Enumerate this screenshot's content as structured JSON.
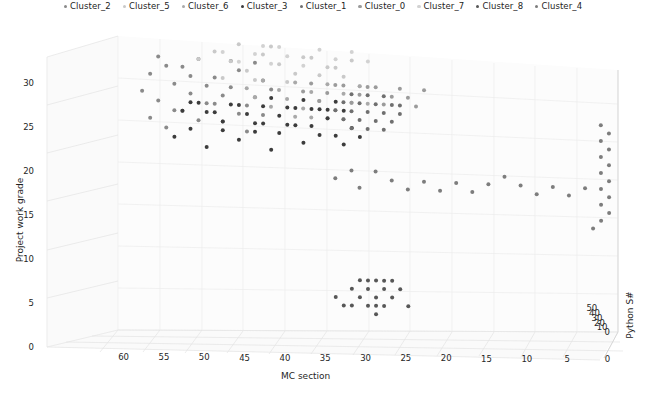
{
  "figure": {
    "background": "#ffffff",
    "projection": "3d",
    "width": 646,
    "height": 394
  },
  "legend": {
    "position": "top-center",
    "marker": "circle",
    "entries": [
      {
        "label": "Cluster_2",
        "color": "#8a8a8a"
      },
      {
        "label": "Cluster_5",
        "color": "#c9c9c9"
      },
      {
        "label": "Cluster_6",
        "color": "#a9a9a9"
      },
      {
        "label": "Cluster_3",
        "color": "#3c3c3c"
      },
      {
        "label": "Cluster_1",
        "color": "#6f6f6f"
      },
      {
        "label": "Cluster_0",
        "color": "#9b9b9b"
      },
      {
        "label": "Cluster_7",
        "color": "#d2d2d2"
      },
      {
        "label": "Cluster_8",
        "color": "#575757"
      },
      {
        "label": "Cluster_4",
        "color": "#7d7d7d"
      }
    ]
  },
  "chart_data": {
    "type": "scatter",
    "title": "",
    "xlabel": "MC section",
    "ylabel": "Project work grade",
    "zlabel": "Python S#",
    "xticks": [
      60,
      55,
      50,
      45,
      40,
      35,
      30,
      25,
      20,
      15,
      10,
      5,
      0
    ],
    "yticks": [
      0,
      5,
      10,
      15,
      20,
      25,
      30
    ],
    "zticks": [
      0,
      10,
      20,
      30,
      40,
      50
    ],
    "xlim": [
      62,
      0
    ],
    "ylim": [
      0,
      33
    ],
    "zlim": [
      0,
      55
    ],
    "grid": true,
    "legend_position": "upper center",
    "series": [
      {
        "name": "Cluster_2",
        "color": "#8a8a8a",
        "points": [
          [
            59,
            27,
            4
          ],
          [
            58,
            29,
            5
          ],
          [
            57,
            26,
            3
          ],
          [
            56,
            30,
            6
          ],
          [
            55,
            28,
            4
          ],
          [
            54,
            25,
            5
          ],
          [
            53,
            27,
            3
          ],
          [
            52,
            31,
            7
          ],
          [
            51,
            26,
            4
          ],
          [
            50,
            29,
            5
          ],
          [
            49,
            24,
            3
          ],
          [
            48,
            28,
            6
          ],
          [
            47,
            30,
            4
          ],
          [
            46,
            26,
            5
          ],
          [
            45,
            27,
            3
          ],
          [
            44,
            29,
            6
          ],
          [
            58,
            24,
            4
          ],
          [
            56,
            23,
            5
          ],
          [
            54,
            30,
            3
          ],
          [
            52,
            24,
            6
          ],
          [
            50,
            26,
            4
          ],
          [
            48,
            31,
            5
          ],
          [
            46,
            23,
            3
          ],
          [
            44,
            25,
            7
          ],
          [
            57,
            31,
            5
          ],
          [
            55,
            25,
            4
          ],
          [
            53,
            29,
            6
          ],
          [
            51,
            28,
            3
          ],
          [
            49,
            27,
            5
          ],
          [
            47,
            25,
            4
          ],
          [
            45,
            31,
            6
          ],
          [
            43,
            28,
            3
          ]
        ]
      },
      {
        "name": "Cluster_5",
        "color": "#c9c9c9",
        "points": [
          [
            50,
            32,
            8
          ],
          [
            48,
            31,
            9
          ],
          [
            46,
            30,
            7
          ],
          [
            44,
            32,
            10
          ],
          [
            42,
            31,
            8
          ],
          [
            40,
            30,
            9
          ],
          [
            38,
            32,
            7
          ],
          [
            36,
            31,
            10
          ],
          [
            49,
            29,
            8
          ],
          [
            47,
            33,
            9
          ],
          [
            45,
            29,
            7
          ],
          [
            43,
            33,
            11
          ],
          [
            41,
            29,
            8
          ],
          [
            39,
            32,
            9
          ],
          [
            37,
            30,
            7
          ],
          [
            35,
            31,
            10
          ],
          [
            52,
            31,
            8
          ],
          [
            34,
            30,
            9
          ],
          [
            33,
            32,
            7
          ],
          [
            32,
            29,
            11
          ]
        ]
      },
      {
        "name": "Cluster_6",
        "color": "#a9a9a9",
        "points": [
          [
            42,
            28,
            12
          ],
          [
            41,
            27,
            13
          ],
          [
            40,
            29,
            11
          ],
          [
            39,
            26,
            14
          ],
          [
            38,
            28,
            12
          ],
          [
            37,
            27,
            13
          ],
          [
            36,
            29,
            11
          ],
          [
            35,
            26,
            14
          ],
          [
            34,
            28,
            12
          ],
          [
            33,
            27,
            13
          ],
          [
            43,
            26,
            11
          ],
          [
            44,
            29,
            14
          ],
          [
            45,
            27,
            12
          ],
          [
            46,
            28,
            13
          ],
          [
            32,
            29,
            11
          ],
          [
            31,
            27,
            14
          ],
          [
            40,
            25,
            12
          ],
          [
            38,
            25,
            13
          ],
          [
            36,
            25,
            11
          ],
          [
            34,
            25,
            14
          ]
        ]
      },
      {
        "name": "Cluster_3",
        "color": "#3c3c3c",
        "points": [
          [
            55,
            22,
            2
          ],
          [
            53,
            23,
            3
          ],
          [
            51,
            21,
            2
          ],
          [
            49,
            24,
            3
          ],
          [
            47,
            22,
            2
          ],
          [
            45,
            23,
            3
          ],
          [
            43,
            21,
            2
          ],
          [
            41,
            24,
            3
          ],
          [
            39,
            22,
            2
          ],
          [
            37,
            23,
            3
          ],
          [
            46,
            25,
            2
          ],
          [
            44,
            26,
            3
          ],
          [
            42,
            25,
            2
          ],
          [
            40,
            26,
            3
          ],
          [
            38,
            24,
            2
          ],
          [
            36,
            25,
            3
          ],
          [
            50,
            25,
            2
          ],
          [
            48,
            26,
            3
          ],
          [
            52,
            26,
            2
          ],
          [
            54,
            25,
            3
          ],
          [
            35,
            23,
            2
          ],
          [
            34,
            22,
            3
          ],
          [
            33,
            24,
            2
          ],
          [
            32,
            23,
            3
          ],
          [
            44,
            24,
            2
          ],
          [
            42,
            23,
            3
          ],
          [
            40,
            24,
            2
          ],
          [
            38,
            26,
            3
          ],
          [
            36,
            26,
            2
          ],
          [
            34,
            26,
            3
          ],
          [
            43,
            27,
            2
          ],
          [
            41,
            26,
            3
          ],
          [
            39,
            27,
            2
          ],
          [
            37,
            26,
            3
          ],
          [
            35,
            27,
            2
          ],
          [
            45,
            24,
            3
          ],
          [
            47,
            26,
            2
          ],
          [
            49,
            23,
            3
          ],
          [
            51,
            25,
            2
          ],
          [
            53,
            26,
            3
          ]
        ]
      },
      {
        "name": "Cluster_1",
        "color": "#6f6f6f",
        "points": [
          [
            33,
            26,
            16
          ],
          [
            32,
            27,
            17
          ],
          [
            31,
            26,
            16
          ],
          [
            30,
            27,
            17
          ],
          [
            29,
            26,
            16
          ],
          [
            33,
            28,
            17
          ],
          [
            32,
            25,
            16
          ],
          [
            31,
            28,
            17
          ],
          [
            30,
            25,
            16
          ],
          [
            29,
            28,
            17
          ],
          [
            34,
            27,
            16
          ],
          [
            35,
            26,
            17
          ],
          [
            28,
            27,
            16
          ],
          [
            27,
            26,
            17
          ],
          [
            34,
            25,
            16
          ],
          [
            28,
            25,
            17
          ],
          [
            33,
            24,
            16
          ],
          [
            31,
            24,
            17
          ],
          [
            29,
            24,
            16
          ],
          [
            27,
            27,
            17
          ]
        ]
      },
      {
        "name": "Cluster_0",
        "color": "#9b9b9b",
        "points": [
          [
            38,
            29,
            18
          ],
          [
            36,
            28,
            19
          ],
          [
            34,
            29,
            18
          ],
          [
            32,
            28,
            19
          ],
          [
            30,
            29,
            18
          ],
          [
            28,
            28,
            19
          ],
          [
            37,
            27,
            18
          ],
          [
            35,
            29,
            19
          ],
          [
            33,
            27,
            18
          ],
          [
            31,
            29,
            19
          ],
          [
            29,
            27,
            18
          ],
          [
            27,
            29,
            19
          ],
          [
            39,
            28,
            18
          ],
          [
            26,
            28,
            19
          ],
          [
            25,
            27,
            18
          ],
          [
            24,
            29,
            19
          ]
        ]
      },
      {
        "name": "Cluster_7",
        "color": "#d2d2d2",
        "points": [
          [
            45,
            32,
            6
          ],
          [
            43,
            31,
            7
          ],
          [
            41,
            32,
            6
          ],
          [
            39,
            31,
            7
          ],
          [
            37,
            33,
            6
          ],
          [
            35,
            32,
            7
          ],
          [
            47,
            31,
            6
          ],
          [
            33,
            33,
            7
          ],
          [
            31,
            32,
            6
          ],
          [
            49,
            32,
            7
          ],
          [
            44,
            33,
            6
          ],
          [
            42,
            33,
            7
          ]
        ]
      },
      {
        "name": "Cluster_8",
        "color": "#575757",
        "points": [
          [
            31,
            5,
            1
          ],
          [
            30,
            4,
            1
          ],
          [
            30,
            6,
            1
          ],
          [
            29,
            5,
            1
          ],
          [
            31,
            3,
            1
          ],
          [
            29,
            3,
            1
          ],
          [
            32,
            4,
            1
          ],
          [
            28,
            4,
            1
          ],
          [
            30,
            3,
            1
          ],
          [
            32,
            6,
            1
          ],
          [
            28,
            6,
            1
          ],
          [
            33,
            5,
            1
          ],
          [
            27,
            5,
            1
          ],
          [
            31,
            6,
            1
          ],
          [
            29,
            6,
            1
          ],
          [
            35,
            4,
            1
          ],
          [
            30,
            2,
            1
          ],
          [
            34,
            3,
            1
          ],
          [
            26,
            3,
            1
          ],
          [
            33,
            3,
            1
          ]
        ]
      },
      {
        "name": "Cluster_4",
        "color": "#7d7d7d",
        "points": [
          [
            35,
            18,
            20
          ],
          [
            30,
            19,
            22
          ],
          [
            28,
            18,
            21
          ],
          [
            26,
            17,
            23
          ],
          [
            24,
            18,
            22
          ],
          [
            22,
            17,
            24
          ],
          [
            20,
            18,
            25
          ],
          [
            18,
            17,
            26
          ],
          [
            16,
            18,
            27
          ],
          [
            12,
            18,
            30
          ],
          [
            10,
            17,
            31
          ],
          [
            8,
            18,
            32
          ],
          [
            6,
            17,
            33
          ],
          [
            4,
            18,
            34
          ],
          [
            2,
            14,
            38
          ],
          [
            2,
            16,
            40
          ],
          [
            2,
            18,
            44
          ],
          [
            2,
            20,
            46
          ],
          [
            2,
            22,
            48
          ],
          [
            2,
            24,
            50
          ],
          [
            2,
            26,
            52
          ],
          [
            1,
            15,
            39
          ],
          [
            1,
            17,
            42
          ],
          [
            1,
            19,
            45
          ],
          [
            1,
            21,
            47
          ],
          [
            1,
            23,
            49
          ],
          [
            1,
            25,
            51
          ],
          [
            3,
            13,
            36
          ],
          [
            14,
            19,
            28
          ],
          [
            32,
            17,
            19
          ],
          [
            33,
            19,
            18
          ]
        ]
      }
    ]
  }
}
